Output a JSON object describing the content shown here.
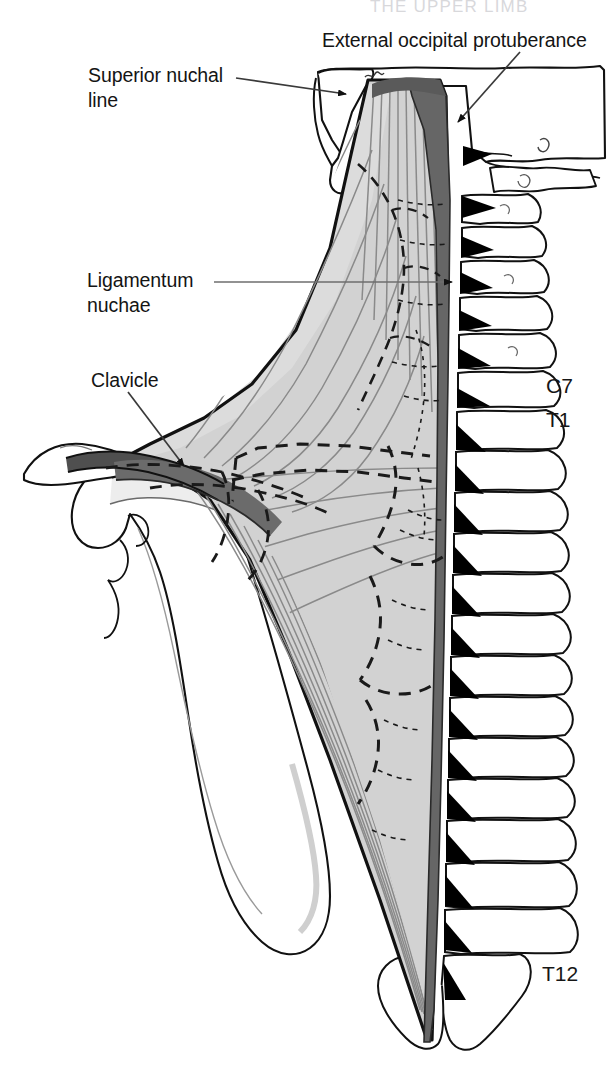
{
  "figure": {
    "title_strip": "THE UPPER LIMB",
    "background_color": "#ffffff",
    "colors": {
      "muscle_fill": "#d2d2d2",
      "muscle_fill_light": "#dcdcdc",
      "attachment_dark": "#666666",
      "bone_fill": "#ffffff",
      "outline": "#111111",
      "fiber_line": "#8a8a8a",
      "dashed_outline": "#1a1a1a",
      "leader_line": "#6e6e6e",
      "spinous_process": "#000000"
    }
  },
  "labels": {
    "external_occipital_protuberance": "External occipital protuberance",
    "superior_nuchal_line_l1": "Superior nuchal",
    "superior_nuchal_line_l2": "line",
    "ligamentum_nuchae_l1": "Ligamentum",
    "ligamentum_nuchae_l2": "nuchae",
    "clavicle": "Clavicle"
  },
  "vertebrae": {
    "c7": "C7",
    "t1": "T1",
    "t12": "T12"
  },
  "leaders": [
    {
      "name": "eop-leader",
      "from": [
        520,
        52
      ],
      "to": [
        455,
        125
      ],
      "arrow": true
    },
    {
      "name": "superior-nuchal-leader",
      "from": [
        235,
        78
      ],
      "to": [
        352,
        94
      ],
      "arrow": true
    },
    {
      "name": "ligamentum-nuchae-leader",
      "from": [
        213,
        282
      ],
      "to": [
        458,
        282
      ],
      "arrow": true
    },
    {
      "name": "clavicle-leader",
      "from": [
        128,
        390
      ],
      "to": [
        185,
        468
      ],
      "arrow": true
    }
  ]
}
